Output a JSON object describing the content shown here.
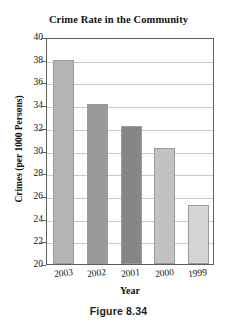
{
  "figure": {
    "caption": "Figure 8.34"
  },
  "chart_data": {
    "type": "bar",
    "title": "Crime Rate in the Community",
    "xlabel": "Year",
    "ylabel": "Crimes (per 1000 Persons)",
    "categories": [
      "2003",
      "2002",
      "2001",
      "2000",
      "1999"
    ],
    "values": [
      38.0,
      34.1,
      32.2,
      30.2,
      25.2
    ],
    "bar_colors": [
      "#b4b4b4",
      "#9a9a9a",
      "#868686",
      "#c2c2c2",
      "#d5d5d5"
    ],
    "ylim": [
      20,
      40
    ],
    "ytick_step": 2,
    "ytick_labels": [
      "40",
      "38",
      "36",
      "34",
      "32",
      "30",
      "28",
      "26",
      "24",
      "22",
      "20"
    ],
    "grid": true,
    "grid_axis": "y",
    "legend": "none",
    "frame": true,
    "xtick_rotation_deg": -6
  }
}
